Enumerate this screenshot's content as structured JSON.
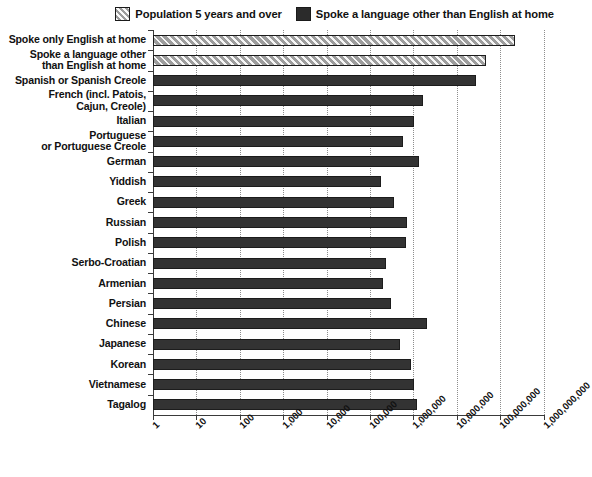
{
  "chart_data": {
    "type": "bar",
    "orientation": "horizontal",
    "title": "",
    "xlabel": "",
    "ylabel": "",
    "xscale": "log",
    "xlim": [
      1,
      1000000000
    ],
    "xticks": [
      1,
      10,
      100,
      1000,
      10000,
      100000,
      1000000,
      10000000,
      100000000,
      1000000000
    ],
    "xticklabels": [
      "1",
      "10",
      "100",
      "1,000",
      "10,000",
      "100,000",
      "1,000,000",
      "10,000,000",
      "100,000,000",
      "1,000,000,000"
    ],
    "grid": "vertical-dotted",
    "legend_position": "top-right",
    "legend": [
      {
        "label": "Population 5 years and over",
        "style": "hatched",
        "color": "#9b9b9b"
      },
      {
        "label": "Spoke a language other than English at home",
        "style": "solid",
        "color": "#333333"
      }
    ],
    "categories": [
      "Spoke only English at home",
      "Spoke a language other than English at home",
      "Spanish or Spanish Creole",
      "French (incl. Patois, Cajun, Creole)",
      "Italian",
      "Portuguese or Portuguese Creole",
      "German",
      "Yiddish",
      "Greek",
      "Russian",
      "Polish",
      "Serbo-Croatian",
      "Armenian",
      "Persian",
      "Chinese",
      "Japanese",
      "Korean",
      "Vietnamese",
      "Tagalog"
    ],
    "values": [
      215000000,
      47000000,
      28000000,
      1650000,
      1010000,
      565000,
      1380000,
      180000,
      365000,
      710000,
      670000,
      235000,
      200000,
      310000,
      2020000,
      480000,
      890000,
      1010000,
      1225000
    ],
    "series": [
      {
        "name": "Population 5 years and over",
        "style": "hatched",
        "items": [
          {
            "category": "Spoke only English at home",
            "value": 215000000
          },
          {
            "category": "Spoke a language other than English at home",
            "value": 47000000
          }
        ]
      },
      {
        "name": "Spoke a language other than English at home",
        "style": "solid",
        "items": [
          {
            "category": "Spanish or Spanish Creole",
            "value": 28000000
          },
          {
            "category": "French (incl. Patois, Cajun, Creole)",
            "value": 1650000
          },
          {
            "category": "Italian",
            "value": 1010000
          },
          {
            "category": "Portuguese or Portuguese Creole",
            "value": 565000
          },
          {
            "category": "German",
            "value": 1380000
          },
          {
            "category": "Yiddish",
            "value": 180000
          },
          {
            "category": "Greek",
            "value": 365000
          },
          {
            "category": "Russian",
            "value": 710000
          },
          {
            "category": "Polish",
            "value": 670000
          },
          {
            "category": "Serbo-Croatian",
            "value": 235000
          },
          {
            "category": "Armenian",
            "value": 200000
          },
          {
            "category": "Persian",
            "value": 310000
          },
          {
            "category": "Chinese",
            "value": 2020000
          },
          {
            "category": "Japanese",
            "value": 480000
          },
          {
            "category": "Korean",
            "value": 890000
          },
          {
            "category": "Vietnamese",
            "value": 1010000
          },
          {
            "category": "Tagalog",
            "value": 1225000
          }
        ]
      }
    ],
    "category_labels_multiline": [
      [
        "Spoke only English at home"
      ],
      [
        "Spoke a language other",
        "than English at home"
      ],
      [
        "Spanish or Spanish Creole"
      ],
      [
        "French (incl. Patois,",
        "Cajun, Creole)"
      ],
      [
        "Italian"
      ],
      [
        "Portuguese",
        "or Portuguese Creole"
      ],
      [
        "German"
      ],
      [
        "Yiddish"
      ],
      [
        "Greek"
      ],
      [
        "Russian"
      ],
      [
        "Polish"
      ],
      [
        "Serbo-Croatian"
      ],
      [
        "Armenian"
      ],
      [
        "Persian"
      ],
      [
        "Chinese"
      ],
      [
        "Japanese"
      ],
      [
        "Korean"
      ],
      [
        "Vietnamese"
      ],
      [
        "Tagalog"
      ]
    ]
  },
  "colors": {
    "hatch_fill": "#9b9b9b",
    "solid_fill": "#333333",
    "axis": "#3a3a3a",
    "grid": "#8d8d8d",
    "text": "#111111",
    "background": "#ffffff"
  }
}
